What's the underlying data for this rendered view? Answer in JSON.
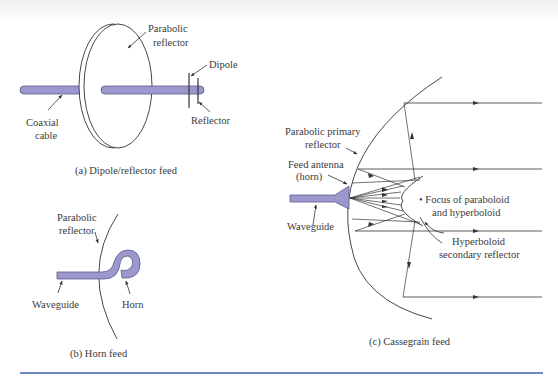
{
  "colors": {
    "feed_fill": "#9a98cc",
    "feed_stroke": "#5a5890",
    "line": "#333333",
    "rule": "#3b5fb0"
  },
  "panel_a": {
    "caption": "(a) Dipole/reflector feed",
    "labels": {
      "parabolic_1": "Parabolic",
      "parabolic_2": "reflector",
      "dipole": "Dipole",
      "reflector": "Reflector",
      "coax_1": "Coaxial",
      "coax_2": "cable"
    }
  },
  "panel_b": {
    "caption": "(b) Horn feed",
    "labels": {
      "parabolic_1": "Parabolic",
      "parabolic_2": "reflector",
      "waveguide": "Waveguide",
      "horn": "Horn"
    }
  },
  "panel_c": {
    "caption": "(c) Cassegrain feed",
    "labels": {
      "primary_1": "Parabolic primary",
      "primary_2": "reflector",
      "feed_1": "Feed antenna",
      "feed_2": "(horn)",
      "waveguide": "Waveguide",
      "focus_1": "• Focus of paraboloid",
      "focus_2": "and hyperboloid",
      "secondary_1": "Hyperboloid",
      "secondary_2": "secondary reflector"
    }
  }
}
